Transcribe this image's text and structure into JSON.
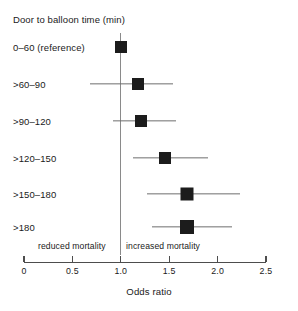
{
  "chart_data": {
    "type": "scatter",
    "subtype": "forest-plot",
    "title": "Door to balloon time (min)",
    "xlabel": "Odds ratio",
    "ylabel": "",
    "xlim": [
      0,
      2.5
    ],
    "xticks": [
      0,
      0.5,
      1.0,
      1.5,
      2.0,
      2.5
    ],
    "xticklabels": [
      "0",
      "0.5",
      "1.0",
      "1.5",
      "2.0",
      "2.5"
    ],
    "grid": false,
    "legend": "none",
    "reference_line": 1.0,
    "annotations": [
      {
        "name": "reduced-mortality",
        "text": "reduced mortality",
        "side": "left"
      },
      {
        "name": "increased-mortality",
        "text": "increased mortality",
        "side": "right"
      }
    ],
    "categories": [
      "0–60 (reference)",
      ">60–90",
      ">90–120",
      ">120–150",
      ">150–180",
      ">180"
    ],
    "values": [
      1.0,
      1.18,
      1.21,
      1.46,
      1.68,
      1.68
    ],
    "ci_low": [
      null,
      0.68,
      0.92,
      1.13,
      1.27,
      1.32
    ],
    "ci_high": [
      null,
      1.54,
      1.57,
      1.9,
      2.23,
      2.15
    ],
    "rows": [
      {
        "label": "0–60 (reference)",
        "odds_ratio": 1.0,
        "ci_low": null,
        "ci_high": null,
        "reference": true,
        "marker_size": 12
      },
      {
        "label": ">60–90",
        "odds_ratio": 1.18,
        "ci_low": 0.68,
        "ci_high": 1.54,
        "reference": false,
        "marker_size": 12
      },
      {
        "label": ">90–120",
        "odds_ratio": 1.21,
        "ci_low": 0.92,
        "ci_high": 1.57,
        "reference": false,
        "marker_size": 12
      },
      {
        "label": ">120–150",
        "odds_ratio": 1.46,
        "ci_low": 1.13,
        "ci_high": 1.9,
        "reference": false,
        "marker_size": 12
      },
      {
        "label": ">150–180",
        "odds_ratio": 1.68,
        "ci_low": 1.27,
        "ci_high": 2.23,
        "reference": false,
        "marker_size": 13
      },
      {
        "label": ">180",
        "odds_ratio": 1.68,
        "ci_low": 1.32,
        "ci_high": 2.15,
        "reference": false,
        "marker_size": 14
      }
    ],
    "colors": {
      "marker": "#1c1c1c",
      "whisker": "#6e6e6e",
      "reference_line": "#8a8a8a",
      "axis": "#4d4d4d",
      "text": "#1a1a1a",
      "background": "#ffffff"
    }
  },
  "layout": {
    "x_left_px": 24,
    "x_right_px": 266,
    "x_min": 0,
    "x_max": 2.5,
    "row_y_px": [
      47,
      84,
      121,
      158,
      194,
      227
    ],
    "reference_line_top_px": 33,
    "reference_line_bottom_px": 255
  }
}
